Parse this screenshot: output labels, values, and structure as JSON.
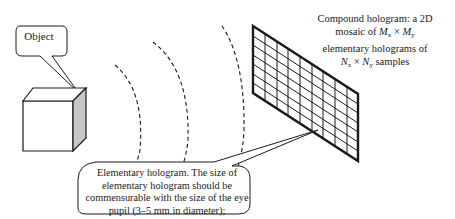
{
  "diagram": {
    "object_callout": {
      "text": "Object"
    },
    "compound_callout": {
      "line1": "Compound hologram: a 2D",
      "line2_prefix": "mosaic of ",
      "M": "M",
      "Mx_sub": "x",
      "times": "×",
      "My_sub": "y",
      "line3": "elementary holograms of",
      "N": "N",
      "Nx_sub": "x",
      "Ny_sub": "y",
      "line4_suffix": " samples"
    },
    "elementary_callout": {
      "line1": "Elementary hologram. The size of",
      "line2": "elementary hologram should be",
      "line3": "commensurable with the size of the eye",
      "line4": "pupil (3–5 mm in diameter);",
      "line5_N": "N",
      "line5_eq": " = ",
      "line5_O": "O",
      "line5_rest": " (1000) samples"
    },
    "elements": [
      "object cube",
      "wavefront arcs (3)",
      "compound hologram grid"
    ],
    "colors": {
      "stroke": "#1a1a1a",
      "cube_side": "#c8c8c8"
    }
  }
}
